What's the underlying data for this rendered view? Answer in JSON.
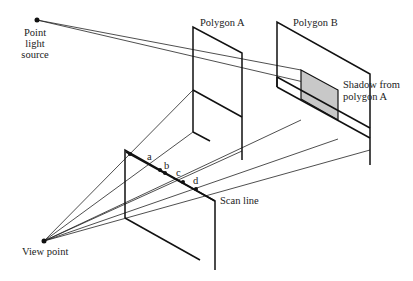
{
  "diagram": {
    "labels": {
      "light_source_line1": "Point",
      "light_source_line2": "light",
      "light_source_line3": "source",
      "polygon_a": "Polygon A",
      "polygon_b": "Polygon B",
      "shadow_line1": "Shadow from",
      "shadow_line2": "polygon A",
      "scan_line": "Scan line",
      "view_point": "View point",
      "point_a": "a",
      "point_b": "b",
      "point_c": "c",
      "point_d": "d"
    },
    "colors": {
      "line": "#111111",
      "shadow_fill": "#c8c8c8",
      "background": "#ffffff"
    }
  }
}
